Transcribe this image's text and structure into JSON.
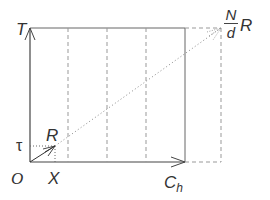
{
  "diagram": {
    "type": "chiral-vector-unit-cell",
    "labels": {
      "T": "T",
      "tau": "τ",
      "R": "R",
      "O": "O",
      "X": "X",
      "Ch_main": "C",
      "Ch_sub": "h",
      "NdR_num": "N",
      "NdR_den": "d",
      "NdR_R": "R"
    },
    "colors": {
      "solid": "#555555",
      "dashed": "#888888",
      "dotted": "#777777",
      "text": "#333333"
    }
  }
}
